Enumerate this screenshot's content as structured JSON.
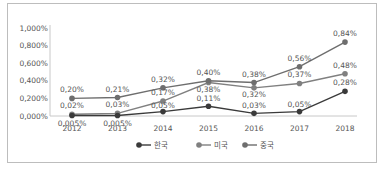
{
  "chart_data": {
    "type": "line",
    "title": "",
    "xlabel": "",
    "ylabel": "",
    "categories": [
      "2012",
      "2013",
      "2014",
      "2015",
      "2016",
      "2017",
      "2018"
    ],
    "y_ticks": [
      "0,000%",
      "0,200%",
      "0,400%",
      "0,600%",
      "0,800%",
      "1,000%"
    ],
    "ylim": [
      0,
      1.0
    ],
    "grid": false,
    "legend_position": "bottom",
    "series": [
      {
        "name": "한국",
        "color": "#3a3a3a",
        "values": [
          0.005,
          0.005,
          0.05,
          0.11,
          0.03,
          0.05,
          0.28
        ],
        "labels": [
          "0,005%",
          "0,005%",
          "0,05%",
          "0,11%",
          "0,03%",
          "0,05%",
          "0,28%"
        ]
      },
      {
        "name": "미국",
        "color": "#808080",
        "values": [
          0.02,
          0.03,
          0.17,
          0.38,
          0.32,
          0.37,
          0.48
        ],
        "labels": [
          "0,02%",
          "0,03%",
          "0,17%",
          "0,38%",
          "0,32%",
          "0,37%",
          "0,48%"
        ]
      },
      {
        "name": "중국",
        "color": "#6e6e6e",
        "values": [
          0.2,
          0.21,
          0.32,
          0.4,
          0.38,
          0.56,
          0.84
        ],
        "labels": [
          "0,20%",
          "0,21%",
          "0,32%",
          "0,40%",
          "0,38%",
          "0,56%",
          "0,84%"
        ]
      }
    ]
  }
}
